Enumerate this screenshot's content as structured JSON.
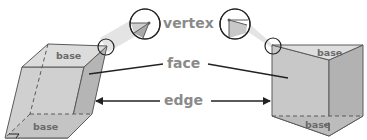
{
  "diagram": {
    "labels": {
      "vertex": "vertex",
      "face": "face",
      "edge": "edge"
    },
    "left_prism": {
      "top_base": "base",
      "bottom_base": "base"
    },
    "right_prism": {
      "top_base": "base",
      "bottom_base": "base"
    },
    "colors": {
      "face_light": "#d3d3d3",
      "face_mid": "#bdbdbd",
      "face_dark": "#a9a9a9",
      "top_face": "#dedede",
      "outline": "#5a5a5a",
      "label_text": "#8a8a8a",
      "base_text": "#6a6a6a",
      "magnifier_cone": "#e4e4e4",
      "arrow": "#222222"
    }
  }
}
